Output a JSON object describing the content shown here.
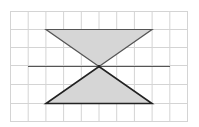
{
  "diagram": {
    "grid": {
      "columns": 10,
      "rows": 6,
      "line_color": "#d4d4d4"
    },
    "shapes": [
      {
        "name": "top-triangle",
        "fill": "#d6d6d6",
        "stroke": "#555555"
      },
      {
        "name": "bottom-triangle",
        "fill": "#d6d6d6",
        "stroke": "#222222"
      }
    ],
    "horizontal_line": {
      "stroke": "#555555"
    }
  }
}
